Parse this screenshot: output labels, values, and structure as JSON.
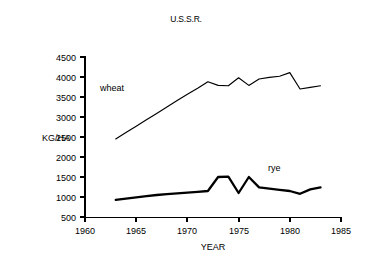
{
  "chart_data": {
    "type": "line",
    "title": "U.S.S.R.",
    "xlabel": "YEAR",
    "ylabel": "KG/HA",
    "xlim": [
      1960,
      1985
    ],
    "ylim": [
      500,
      4500
    ],
    "xticks": [
      1960,
      1965,
      1970,
      1975,
      1980,
      1985
    ],
    "yticks": [
      500,
      1000,
      1500,
      2000,
      2500,
      3000,
      3500,
      4000,
      4500
    ],
    "grid": false,
    "legend_position": "inline-labels",
    "series": [
      {
        "name": "wheat",
        "label": "wheat",
        "x": [
          1963,
          1964,
          1965,
          1966,
          1967,
          1968,
          1969,
          1970,
          1971,
          1972,
          1973,
          1974,
          1975,
          1976,
          1977,
          1978,
          1979,
          1980,
          1981,
          1982,
          1983
        ],
        "values": [
          2450,
          2610,
          2770,
          2930,
          3090,
          3250,
          3410,
          3570,
          3720,
          3880,
          3790,
          3780,
          3980,
          3790,
          3950,
          3990,
          4020,
          4110,
          3700,
          3740,
          3780
        ]
      },
      {
        "name": "rye",
        "label": "rye",
        "x": [
          1963,
          1964,
          1965,
          1966,
          1967,
          1968,
          1969,
          1970,
          1971,
          1972,
          1973,
          1974,
          1975,
          1976,
          1977,
          1978,
          1979,
          1980,
          1981,
          1982,
          1983
        ],
        "values": [
          930,
          960,
          990,
          1020,
          1050,
          1070,
          1090,
          1110,
          1130,
          1150,
          1500,
          1510,
          1100,
          1500,
          1240,
          1210,
          1180,
          1150,
          1080,
          1190,
          1240
        ]
      }
    ]
  },
  "labels": {
    "title": "U.S.S.R.",
    "y_axis_title": "KG/HA",
    "x_axis_title": "YEAR",
    "wheat_label": "wheat",
    "rye_label": "rye",
    "ytick_4500": "4500",
    "ytick_4000": "4000",
    "ytick_3500": "3500",
    "ytick_3000": "3000",
    "ytick_2500": "2500",
    "ytick_2000": "2000",
    "ytick_1500": "1500",
    "ytick_1000": "1000",
    "ytick_500": "500",
    "xtick_1960": "1960",
    "xtick_1965": "1965",
    "xtick_1970": "1970",
    "xtick_1975": "1975",
    "xtick_1980": "1980",
    "xtick_1985": "1985"
  },
  "colors": {
    "background": "#ffffff",
    "ink": "#000000"
  }
}
